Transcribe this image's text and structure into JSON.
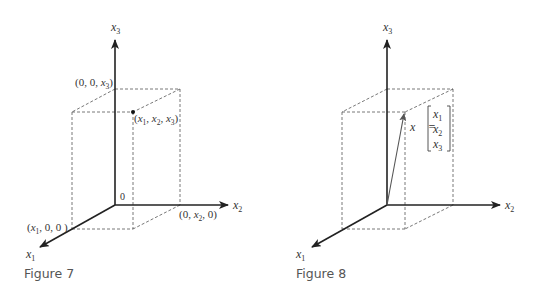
{
  "figures": [
    {
      "caption": "Figure 7",
      "axis_labels": {
        "x1": "x",
        "x1_sub": "1",
        "x2": "x",
        "x2_sub": "2",
        "x3": "x",
        "x3_sub": "3"
      },
      "origin_label": "0",
      "points": {
        "x3_point": "(0, 0, x3)",
        "x2_point": "(0, x2, 0)",
        "x1_point": "(x1, 0, 0)",
        "xyz_point": "(x1, x2, x3)"
      }
    },
    {
      "caption": "Figure 8",
      "axis_labels": {
        "x1": "x",
        "x1_sub": "1",
        "x2": "x",
        "x2_sub": "2",
        "x3": "x",
        "x3_sub": "3"
      },
      "vector_label": "x⃗ =",
      "vector_components": [
        "x1",
        "x2",
        "x3"
      ]
    }
  ]
}
